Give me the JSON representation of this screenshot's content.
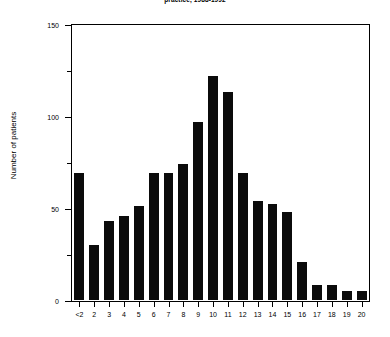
{
  "chart_data": {
    "type": "bar",
    "title": "practice, 1988-1992",
    "xlabel": "",
    "ylabel": "Number of patients",
    "categories": [
      "<2",
      "2",
      "3",
      "4",
      "5",
      "6",
      "7",
      "8",
      "9",
      "10",
      "11",
      "12",
      "13",
      "14",
      "15",
      "16",
      "17",
      "18",
      "19",
      "20"
    ],
    "values": [
      70,
      31,
      44,
      47,
      52,
      70,
      70,
      75,
      98,
      123,
      114,
      70,
      55,
      53,
      49,
      22,
      9,
      9,
      6,
      6
    ],
    "ylim": [
      0,
      150
    ],
    "yticks": [
      0,
      50,
      100,
      150
    ],
    "ytick_labels": [
      "0",
      "50",
      "100",
      "150"
    ],
    "yticks_minor": [
      25,
      75,
      125
    ],
    "grid": false,
    "legend": null,
    "bar_color": "#0b0b0b"
  },
  "axes": {
    "y_title": "Number of patients",
    "y_tick_labels": [
      "0",
      "50",
      "100",
      "150"
    ],
    "x_tick_labels": [
      "<2",
      "2",
      "3",
      "4",
      "5",
      "6",
      "7",
      "8",
      "9",
      "10",
      "11",
      "12",
      "13",
      "14",
      "15",
      "16",
      "17",
      "18",
      "19",
      "20"
    ]
  },
  "title": "practice, 1988-1992"
}
